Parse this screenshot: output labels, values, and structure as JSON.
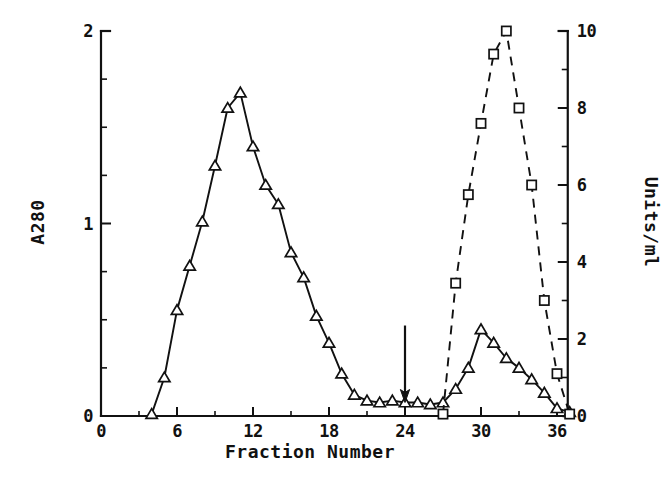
{
  "chart_data": {
    "type": "line",
    "title": "",
    "xlabel": "Fraction Number",
    "ylabel": "A280",
    "y2label": "Units/ml",
    "xlim": [
      0,
      38
    ],
    "ylim": [
      0,
      2
    ],
    "y2lim": [
      0,
      10
    ],
    "grid": false,
    "legend_position": "none",
    "xticks": [
      0,
      6,
      12,
      18,
      24,
      30,
      36
    ],
    "xtick_labels": [
      "0",
      "6",
      "12",
      "18",
      "24",
      "30",
      "36"
    ],
    "xminor_ticks": [
      3,
      9,
      15,
      21,
      27,
      33
    ],
    "yticks": [
      0,
      1,
      2
    ],
    "ytick_labels": [
      "0",
      "1",
      "2"
    ],
    "yminor_ticks": [
      0.25,
      0.5,
      0.75,
      1.25,
      1.5,
      1.75
    ],
    "y2ticks": [
      0,
      2,
      4,
      6,
      8,
      10
    ],
    "y2tick_labels": [
      "0",
      "2",
      "4",
      "6",
      "8",
      "10"
    ],
    "y2minor_ticks": [
      1,
      3,
      5,
      7,
      9
    ],
    "annotations": [
      {
        "name": "down-arrow-marker",
        "kind": "arrow",
        "x": 24,
        "y_from": 0.47,
        "y_to": 0.07,
        "label": ""
      }
    ],
    "series": [
      {
        "name": "A280",
        "axis": "left",
        "marker": "triangle",
        "linestyle": "solid",
        "x": [
          4,
          5,
          6,
          7,
          8,
          9,
          10,
          11,
          12,
          13,
          14,
          15,
          16,
          17,
          18,
          19,
          20,
          21,
          22,
          23,
          24,
          25,
          26,
          27,
          28,
          29,
          30,
          31,
          32,
          33,
          34,
          35,
          36,
          37
        ],
        "values": [
          0.01,
          0.2,
          0.55,
          0.78,
          1.01,
          1.3,
          1.6,
          1.68,
          1.4,
          1.2,
          1.1,
          0.85,
          0.72,
          0.52,
          0.38,
          0.22,
          0.11,
          0.08,
          0.07,
          0.08,
          0.07,
          0.07,
          0.06,
          0.07,
          0.14,
          0.25,
          0.45,
          0.38,
          0.3,
          0.25,
          0.19,
          0.12,
          0.04,
          0.02
        ]
      },
      {
        "name": "Units/ml",
        "axis": "right",
        "marker": "square",
        "linestyle": "dashed",
        "x": [
          27,
          28,
          29,
          30,
          31,
          32,
          33,
          34,
          35,
          36,
          37
        ],
        "values": [
          0.05,
          3.45,
          5.75,
          7.6,
          9.4,
          10.0,
          8.0,
          6.0,
          3.0,
          1.1,
          0.05
        ]
      }
    ]
  },
  "axes": {
    "left_title": "A280",
    "right_title": "Units/ml",
    "bottom_title": "Fraction Number"
  }
}
